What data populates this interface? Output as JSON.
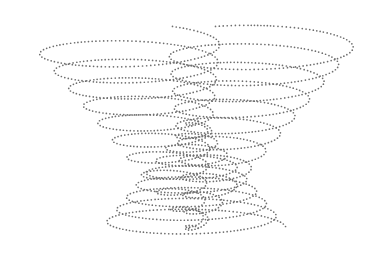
{
  "artwork": {
    "description": "Dotted-line spiral helix illustration: two wing-like helical spirals at top converging into a cone at bottom",
    "background": "#ffffff",
    "dot_color": "#6e6e6e",
    "dot_radius": 0.85,
    "dot_spacing": 3.2,
    "helices": [
      {
        "name": "left-wing-helix",
        "turns": 11,
        "top": {
          "cx": 125,
          "cy": 42,
          "rx": 95,
          "ry": 18
        },
        "bottom": {
          "cx": 196,
          "cy": 232,
          "rx": 6,
          "ry": 4
        },
        "start_angle_deg": 300,
        "end_cut_deg": 0
      },
      {
        "name": "right-wing-helix",
        "turns": 11,
        "top": {
          "cx": 263,
          "cy": 42,
          "rx": 95,
          "ry": 18
        },
        "bottom": {
          "cx": 192,
          "cy": 232,
          "rx": 6,
          "ry": 4
        },
        "start_angle_deg": 240,
        "end_cut_deg": 0
      },
      {
        "name": "lower-cone-helix",
        "turns": 9,
        "top": {
          "cx": 194,
          "cy": 118,
          "rx": 4,
          "ry": 3
        },
        "bottom": {
          "cx": 194,
          "cy": 228,
          "rx": 92,
          "ry": 16
        },
        "start_angle_deg": 0,
        "end_cut_deg": 0
      }
    ]
  }
}
